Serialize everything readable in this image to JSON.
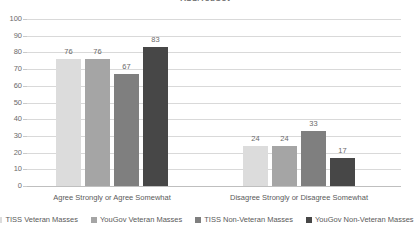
{
  "chart_data": {
    "type": "bar",
    "title": "TISS/YouGov",
    "categories": [
      "Agree Strongly or Agree Somewhat",
      "Disagree Strongly or Disagree Somewhat"
    ],
    "series": [
      {
        "name": "TISS Veteran Masses",
        "values": [
          76,
          24
        ],
        "color": "#dcdcdc"
      },
      {
        "name": "YouGov Veteran Masses",
        "values": [
          76,
          24
        ],
        "color": "#a5a5a5"
      },
      {
        "name": "TISS Non-Veteran Masses",
        "values": [
          67,
          33
        ],
        "color": "#7f7f7f"
      },
      {
        "name": "YouGov Non-Veteran Masses",
        "values": [
          83,
          17
        ],
        "color": "#474747"
      }
    ],
    "xlabel": "",
    "ylabel": "",
    "ylim": [
      0,
      100
    ],
    "ytick_labels": [
      "100",
      "90",
      "80",
      "70",
      "60",
      "50",
      "40",
      "30",
      "20",
      "10",
      "0"
    ],
    "ytick_values": [
      100,
      90,
      80,
      70,
      60,
      50,
      40,
      30,
      20,
      10,
      0
    ],
    "grid": true,
    "legend_position": "bottom",
    "data_labels": true
  },
  "colors": {
    "gridline": "#d9d9d9",
    "axis": "#bfbfbf",
    "text": "#5a5a5a",
    "background": "#ffffff"
  }
}
